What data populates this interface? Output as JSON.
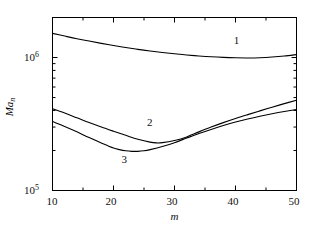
{
  "chart_data": {
    "type": "line",
    "title": "",
    "xlabel": "m",
    "ylabel": "Ma_n",
    "ylabel_base": "Ma",
    "ylabel_sub": "n",
    "xscale": "linear",
    "yscale": "log",
    "xlim": [
      10,
      50
    ],
    "ylim": [
      100000,
      2000000
    ],
    "grid": false,
    "legend": "inline-curve-numbers",
    "x_ticks_major": [
      10,
      20,
      30,
      40,
      50
    ],
    "x_tick_labels": [
      "10",
      "20",
      "30",
      "40",
      "50"
    ],
    "x_ticks_minor": [
      15,
      25,
      35,
      45
    ],
    "y_ticks_major": [
      100000,
      1000000
    ],
    "y_tick_labels": [
      "10⁵",
      "10⁶"
    ],
    "y_tick_mantissa": [
      "10",
      "10"
    ],
    "y_tick_exponents": [
      "5",
      "6"
    ],
    "series": [
      {
        "name": "1",
        "label": "1",
        "label_x": 40.2,
        "label_y": 1320000,
        "color": "#000000",
        "x": [
          10,
          12,
          14,
          16,
          18,
          20,
          22,
          24,
          26,
          28,
          30,
          32,
          34,
          36,
          38,
          40,
          42,
          44,
          46,
          48,
          50
        ],
        "y": [
          1520000,
          1450000,
          1385000,
          1330000,
          1278000,
          1232000,
          1190000,
          1152000,
          1120000,
          1092000,
          1068000,
          1046000,
          1028000,
          1013000,
          1002000,
          995000,
          993000,
          997000,
          1008000,
          1026000,
          1052000
        ]
      },
      {
        "name": "2",
        "label": "2",
        "label_x": 26.0,
        "label_y": 322000,
        "color": "#000000",
        "x": [
          10,
          12,
          14,
          16,
          18,
          20,
          22,
          24,
          26,
          27,
          28,
          30,
          32,
          34,
          36,
          38,
          40,
          42,
          44,
          46,
          48,
          50
        ],
        "y": [
          412000,
          382000,
          352000,
          324000,
          300000,
          279000,
          260000,
          243000,
          231000,
          228000,
          229000,
          238000,
          253000,
          276000,
          300000,
          324000,
          348000,
          372000,
          397000,
          423000,
          450000,
          478000
        ]
      },
      {
        "name": "3",
        "label": "3",
        "label_x": 21.8,
        "label_y": 171000,
        "color": "#000000",
        "x": [
          10,
          12,
          14,
          16,
          18,
          20,
          21,
          22,
          23,
          24,
          25,
          26,
          28,
          30,
          32,
          34,
          36,
          38,
          40,
          42,
          44,
          46,
          48,
          50
        ],
        "y": [
          330000,
          303000,
          276000,
          250000,
          228000,
          209000,
          203000,
          199000,
          197000,
          197000,
          199000,
          203000,
          214000,
          229000,
          248000,
          268000,
          288000,
          308000,
          327000,
          345000,
          362000,
          378000,
          393000,
          407000
        ]
      }
    ]
  },
  "axes": {
    "x_axis_name": "m-axis",
    "y_axis_name": "Man-axis"
  }
}
